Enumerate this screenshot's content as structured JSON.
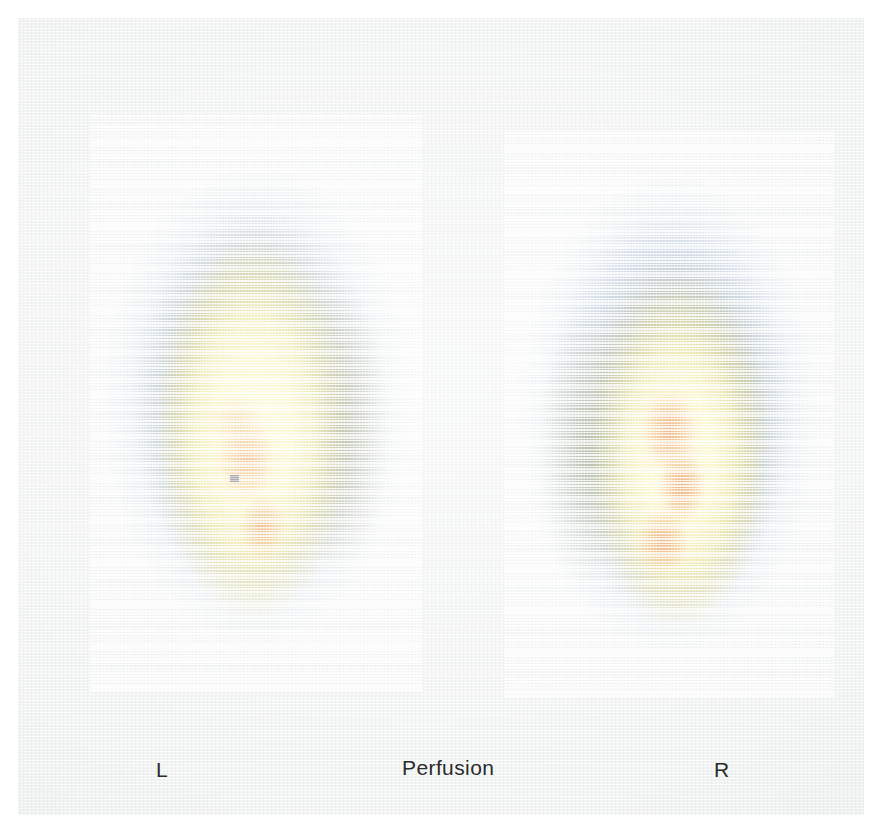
{
  "study": {
    "modality_label": "Perfusion",
    "left_marker_label": "L",
    "right_marker_label": "R"
  },
  "palette": {
    "background_paper": "#eff2f1",
    "page_white": "#ffffff",
    "cold_blue": "#7e8cb8",
    "mid_green": "#8a9040",
    "core_yellow": "#fef6b0",
    "hot_orange": "#e27428",
    "marker_dark": "#5c6472",
    "text": "#2b2b2b"
  },
  "views": [
    {
      "name": "left-lung-view",
      "side_label": "L",
      "intensity_zones": [
        "cold-blue",
        "mid-green",
        "core-yellow",
        "hot-orange"
      ],
      "hot_spot_count": 3,
      "has_marker": true
    },
    {
      "name": "right-lung-view",
      "side_label": "R",
      "intensity_zones": [
        "cold-blue",
        "mid-green",
        "core-yellow",
        "hot-orange"
      ],
      "hot_spot_count": 3,
      "has_marker": false
    }
  ]
}
